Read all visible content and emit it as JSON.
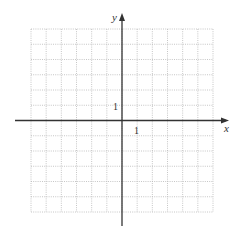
{
  "chart_data": {
    "type": "scatter",
    "title": "",
    "xlabel": "x",
    "ylabel": "y",
    "xlim": [
      -6,
      6
    ],
    "ylim": [
      -6,
      6
    ],
    "grid": true,
    "grid_style": "dotted",
    "tick_labels": {
      "x": [
        "1"
      ],
      "y": [
        "1"
      ]
    },
    "series": [],
    "annotations": []
  },
  "axes": {
    "x_label": "x",
    "y_label": "y",
    "x_tick_label": "1",
    "y_tick_label": "1"
  },
  "colors": {
    "grid": "#b8b8b8",
    "axis": "#333333",
    "background": "#ffffff"
  }
}
